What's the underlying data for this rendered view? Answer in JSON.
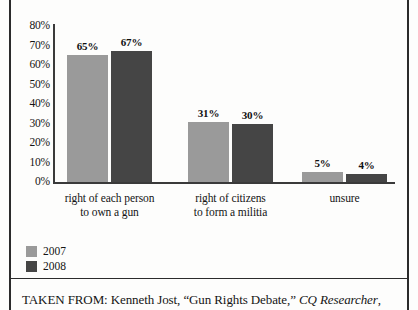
{
  "chart_data": {
    "type": "bar",
    "title": "",
    "xlabel": "",
    "ylabel": "",
    "ylim": [
      0,
      80
    ],
    "grid": false,
    "legend_position": "bottom-left",
    "categories": [
      "right of each person\nto own a gun",
      "right of citizens\nto form a militia",
      "unsure"
    ],
    "category_lines": [
      [
        "right of each person",
        "to own a gun"
      ],
      [
        "right of citizens",
        "to form a militia"
      ],
      [
        "unsure"
      ]
    ],
    "ytick_labels": [
      "80%",
      "70%",
      "60%",
      "50%",
      "40%",
      "30%",
      "20%",
      "10%",
      "0%"
    ],
    "ytick_values": [
      80,
      70,
      60,
      50,
      40,
      30,
      20,
      10,
      0
    ],
    "series": [
      {
        "name": "2007",
        "color": "#9a9a9a",
        "values": [
          65,
          31,
          5
        ],
        "value_labels": [
          "65%",
          "31%",
          "5%"
        ]
      },
      {
        "name": "2008",
        "color": "#454545",
        "values": [
          67,
          30,
          4
        ],
        "value_labels": [
          "67%",
          "30%",
          "4%"
        ]
      }
    ]
  },
  "legend": {
    "items": [
      {
        "label": "2007",
        "color": "#9a9a9a"
      },
      {
        "label": "2008",
        "color": "#454545"
      }
    ]
  },
  "caption": {
    "prefix": "TAKEN FROM: Kenneth Jost, “Gun Rights Debate,” ",
    "source_italic": "CQ Researcher",
    "suffix": ","
  },
  "colors": {
    "series_2007": "#9a9a9a",
    "series_2008": "#454545",
    "axis": "#3a3a3a",
    "frame": "#2b2b2b",
    "text": "#141414"
  }
}
